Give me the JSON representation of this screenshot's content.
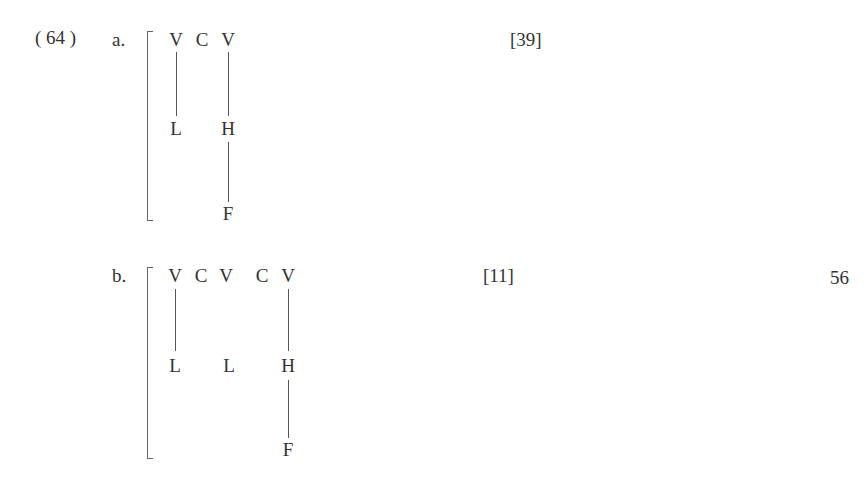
{
  "example_number": "( 64 )",
  "page_number": "56",
  "examples": [
    {
      "label": "a.",
      "reference": "[39]",
      "tiers": {
        "segments": [
          "V",
          "C",
          "V"
        ],
        "tones": [
          "L",
          "H"
        ],
        "floating": [
          "F"
        ]
      }
    },
    {
      "label": "b.",
      "reference": "[11]",
      "tiers": {
        "segments": [
          "V",
          "C",
          "V",
          "C",
          "V"
        ],
        "tones": [
          "L",
          "L",
          "H"
        ],
        "floating": [
          "F"
        ]
      }
    }
  ]
}
